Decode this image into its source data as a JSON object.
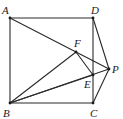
{
  "figure": {
    "type": "geometry-diagram",
    "points": [
      {
        "name": "A",
        "label": "A"
      },
      {
        "name": "B",
        "label": "B"
      },
      {
        "name": "C",
        "label": "C"
      },
      {
        "name": "D",
        "label": "D"
      },
      {
        "name": "E",
        "label": "E"
      },
      {
        "name": "F",
        "label": "F"
      },
      {
        "name": "P",
        "label": "P"
      }
    ],
    "segments": [
      [
        "A",
        "D"
      ],
      [
        "D",
        "C"
      ],
      [
        "C",
        "B"
      ],
      [
        "B",
        "A"
      ],
      [
        "A",
        "P"
      ],
      [
        "D",
        "P"
      ],
      [
        "C",
        "P"
      ],
      [
        "B",
        "F"
      ],
      [
        "B",
        "E"
      ],
      [
        "B",
        "P"
      ],
      [
        "F",
        "E"
      ]
    ]
  }
}
